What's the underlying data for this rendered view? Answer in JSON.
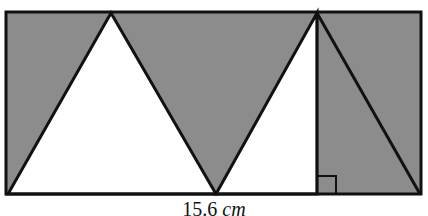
{
  "figure": {
    "colors": {
      "shaded": "#8c8c8c",
      "unshaded": "#ffffff",
      "stroke": "#111111"
    },
    "rectangle": {
      "x1": 6,
      "y1": 12,
      "x2": 421,
      "y2": 194
    },
    "white_triangles": [
      {
        "points": "8,194 111,13 216,194"
      },
      {
        "points": "216,194 317,13 317,194"
      }
    ],
    "lines": [
      {
        "name": "altitude",
        "x1": 317,
        "y1": 13,
        "x2": 317,
        "y2": 194
      },
      {
        "name": "right-diagonal",
        "x1": 317,
        "y1": 13,
        "x2": 421,
        "y2": 194
      }
    ],
    "right_angle_marker": {
      "x": 319,
      "y": 176,
      "size": 17
    },
    "base_label": {
      "number": "15.6",
      "unit": "cm"
    }
  }
}
